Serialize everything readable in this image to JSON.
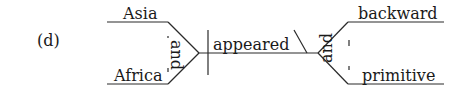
{
  "label": "(d)",
  "diagram": {
    "type": "sentence-diagram",
    "compound_subject": {
      "words": [
        "Asia",
        "Africa"
      ],
      "conjunction": "and"
    },
    "verb": "appeared",
    "compound_complement": {
      "words": [
        "backward",
        "primitive"
      ],
      "conjunction": "and"
    }
  }
}
